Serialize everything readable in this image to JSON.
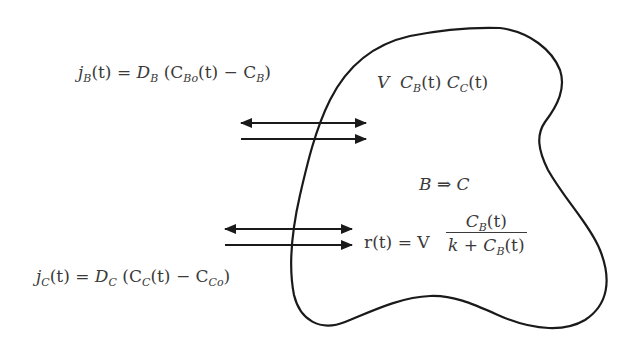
{
  "diagram": {
    "stroke_color": "#1a1a1a",
    "text_color": "#3a3a3a",
    "flux_B": {
      "lhs": "j",
      "lhs_sub": "B",
      "lhs_arg": "(t) = ",
      "coef": "D",
      "coef_sub": "B",
      "open": " (C",
      "term1_sub": "Bo",
      "term1_arg": "(t) − C",
      "term2_sub": "B",
      "close": ")"
    },
    "flux_C": {
      "lhs": "j",
      "lhs_sub": "C",
      "lhs_arg": "(t) = ",
      "coef": "D",
      "coef_sub": "C",
      "open": " (C",
      "term1_sub": "C",
      "term1_arg": "(t) − C",
      "term2_sub": "Co",
      "close": ")"
    },
    "state": {
      "v": "V",
      "cb": "C",
      "cb_sub": "B",
      "cb_arg": "(t)",
      "cc": "C",
      "cc_sub": "C",
      "cc_arg": "(t)"
    },
    "reaction": {
      "reactant": "B",
      "arrow": "⇒",
      "product": "C"
    },
    "rate": {
      "lhs": "r(t) = V",
      "numerator": "C",
      "numerator_sub": "B",
      "numerator_arg": "(t)",
      "denominator_k": "k + C",
      "denominator_sub": "B",
      "denominator_arg": "(t)"
    },
    "arrows": [
      {
        "name": "flux-B-bidirectional-arrow",
        "x1": 241,
        "x2": 366,
        "y": 123,
        "heads": "both"
      },
      {
        "name": "flux-B-inward-arrow",
        "x1": 241,
        "x2": 366,
        "y": 139,
        "heads": "end"
      },
      {
        "name": "flux-C-bidirectional-arrow",
        "x1": 225,
        "x2": 352,
        "y": 229,
        "heads": "both"
      },
      {
        "name": "flux-C-inward-arrow",
        "x1": 225,
        "x2": 352,
        "y": 245,
        "heads": "end"
      }
    ]
  }
}
